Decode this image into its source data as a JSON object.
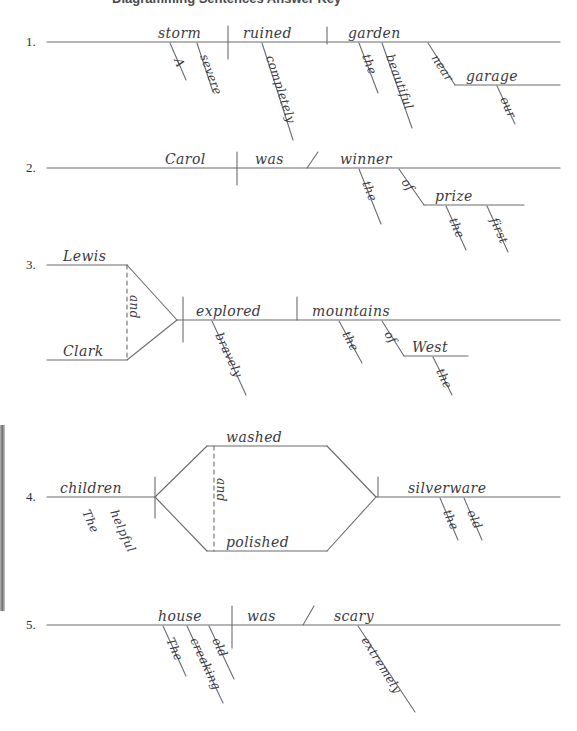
{
  "page": {
    "title_partial": "Diagramming Sentences Answer Key",
    "width": 577,
    "height": 731,
    "ink_color": "#3a3a42",
    "rule_color": "#6b6b73",
    "background": "#ffffff"
  },
  "exercises": [
    {
      "number": "1.",
      "sentence": "A severe storm completely ruined the beautiful garden near our garage.",
      "subject": "storm",
      "verb": "ruined",
      "object": "garden",
      "modifiers": [
        "A",
        "severe",
        "completely",
        "the",
        "beautiful",
        "our"
      ],
      "prepositional_phrases": [
        {
          "preposition": "near",
          "object": "garage",
          "modifier": "our"
        }
      ],
      "compound": false,
      "baseline_y": 42
    },
    {
      "number": "2.",
      "sentence": "Carol was the winner of the first prize.",
      "subject": "Carol",
      "verb": "was",
      "predicate_nominative": "winner",
      "modifiers": [
        "the",
        "the",
        "first"
      ],
      "prepositional_phrases": [
        {
          "preposition": "of",
          "object": "prize",
          "modifiers": [
            "the",
            "first"
          ]
        }
      ],
      "compound": false,
      "baseline_y": 168
    },
    {
      "number": "3.",
      "sentence": "Lewis and Clark bravely explored the mountains of the West.",
      "subject_compound": [
        "Lewis",
        "Clark"
      ],
      "conjunction": "and",
      "verb": "explored",
      "object": "mountains",
      "modifiers": [
        "bravely",
        "the",
        "the"
      ],
      "prepositional_phrases": [
        {
          "preposition": "of",
          "object": "West",
          "modifier": "the"
        }
      ],
      "compound": true,
      "baseline_y": 320
    },
    {
      "number": "4.",
      "sentence": "The helpful children washed and polished the old silverware.",
      "subject": "children",
      "verb_compound": [
        "washed",
        "polished"
      ],
      "conjunction": "and",
      "object": "silverware",
      "modifiers": [
        "The",
        "helpful",
        "the",
        "old"
      ],
      "compound": true,
      "baseline_y": 497
    },
    {
      "number": "5.",
      "sentence": "The old creaking house was extremely scary.",
      "subject": "house",
      "verb": "was",
      "predicate_adjective": "scary",
      "modifiers": [
        "The",
        "creaking",
        "old",
        "extremely"
      ],
      "compound": false,
      "baseline_y": 625
    }
  ],
  "labels": {
    "n1": "1.",
    "n2": "2.",
    "n3": "3.",
    "n4": "4.",
    "n5": "5.",
    "w_storm": "storm",
    "w_a": "A",
    "w_severe": "severe",
    "w_ruined": "ruined",
    "w_completely": "completely",
    "w_garden": "garden",
    "w_the1": "the",
    "w_beautiful": "beautiful",
    "w_near": "near",
    "w_garage": "garage",
    "w_our": "our",
    "w_carol": "Carol",
    "w_was2": "was",
    "w_winner": "winner",
    "w_the2": "the",
    "w_of2": "of",
    "w_prize": "prize",
    "w_the2b": "the",
    "w_first": "first",
    "w_lewis": "Lewis",
    "w_clark": "Clark",
    "w_and3": "and",
    "w_explored": "explored",
    "w_bravely": "bravely",
    "w_mountains": "mountains",
    "w_the3": "the",
    "w_of3": "of",
    "w_west": "West",
    "w_the3b": "the",
    "w_children": "children",
    "w_The4": "The",
    "w_helpful": "helpful",
    "w_washed": "washed",
    "w_and4": "and",
    "w_polished": "polished",
    "w_silverware": "silverware",
    "w_the4": "the",
    "w_old4": "old",
    "w_house": "house",
    "w_The5": "The",
    "w_creaking": "creaking",
    "w_old5": "old",
    "w_was5": "was",
    "w_scary": "scary",
    "w_extremely": "extremely"
  }
}
